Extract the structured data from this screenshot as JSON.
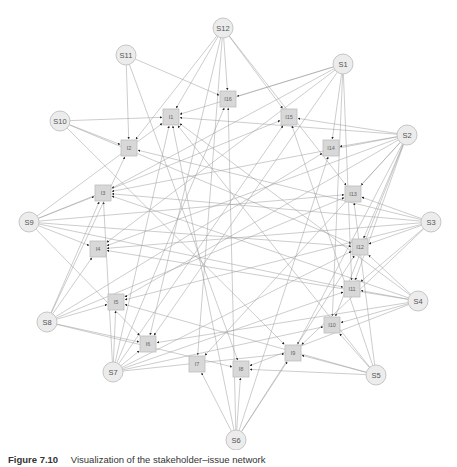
{
  "figure": {
    "caption": {
      "number": "Figure 7.10",
      "text": "Visualization of the stakeholder–issue network"
    },
    "colors": {
      "edge": "#9a9a9a",
      "arrow": "#222222",
      "stakeholder_fill": "#ececec",
      "issue_fill": "#d8d8d8"
    },
    "stakeholders": [
      {
        "id": "S1",
        "label": "S1",
        "x": 343,
        "y": 64
      },
      {
        "id": "S2",
        "label": "S2",
        "x": 407,
        "y": 135
      },
      {
        "id": "S3",
        "label": "S3",
        "x": 431,
        "y": 222
      },
      {
        "id": "S4",
        "label": "S4",
        "x": 418,
        "y": 301
      },
      {
        "id": "S5",
        "label": "S5",
        "x": 376,
        "y": 375
      },
      {
        "id": "S6",
        "label": "S6",
        "x": 236,
        "y": 440
      },
      {
        "id": "S7",
        "label": "S7",
        "x": 113,
        "y": 372
      },
      {
        "id": "S8",
        "label": "S8",
        "x": 47,
        "y": 322
      },
      {
        "id": "S9",
        "label": "S9",
        "x": 29,
        "y": 222
      },
      {
        "id": "S10",
        "label": "S10",
        "x": 60,
        "y": 121
      },
      {
        "id": "S11",
        "label": "S11",
        "x": 126,
        "y": 55
      },
      {
        "id": "S12",
        "label": "S12",
        "x": 223,
        "y": 28
      }
    ],
    "issues": [
      {
        "id": "I1",
        "label": "I1",
        "x": 171,
        "y": 117
      },
      {
        "id": "I2",
        "label": "I2",
        "x": 129,
        "y": 148
      },
      {
        "id": "I3",
        "label": "I3",
        "x": 103,
        "y": 193
      },
      {
        "id": "I4",
        "label": "I4",
        "x": 98,
        "y": 249
      },
      {
        "id": "I5",
        "label": "I5",
        "x": 116,
        "y": 302
      },
      {
        "id": "I6",
        "label": "I6",
        "x": 148,
        "y": 344
      },
      {
        "id": "I7",
        "label": "I7",
        "x": 197,
        "y": 364
      },
      {
        "id": "I8",
        "label": "I8",
        "x": 241,
        "y": 369
      },
      {
        "id": "I9",
        "label": "I9",
        "x": 293,
        "y": 353
      },
      {
        "id": "I10",
        "label": "I10",
        "x": 332,
        "y": 325
      },
      {
        "id": "I11",
        "label": "I11",
        "x": 352,
        "y": 289
      },
      {
        "id": "I12",
        "label": "I12",
        "x": 360,
        "y": 247
      },
      {
        "id": "I13",
        "label": "I13",
        "x": 353,
        "y": 194
      },
      {
        "id": "I14",
        "label": "I14",
        "x": 331,
        "y": 148
      },
      {
        "id": "I15",
        "label": "I15",
        "x": 289,
        "y": 117
      },
      {
        "id": "I16",
        "label": "I16",
        "x": 228,
        "y": 99
      }
    ],
    "edges": [
      [
        "S12",
        "I1"
      ],
      [
        "S12",
        "I16"
      ],
      [
        "S12",
        "I15"
      ],
      [
        "S12",
        "I7"
      ],
      [
        "S12",
        "I6"
      ],
      [
        "S12",
        "I2"
      ],
      [
        "S12",
        "I13"
      ],
      [
        "S11",
        "I2"
      ],
      [
        "S11",
        "I16"
      ],
      [
        "S11",
        "I8"
      ],
      [
        "S10",
        "I1"
      ],
      [
        "S10",
        "I2"
      ],
      [
        "S10",
        "I12"
      ],
      [
        "S10",
        "I9"
      ],
      [
        "S1",
        "I16"
      ],
      [
        "S1",
        "I1"
      ],
      [
        "S1",
        "I3"
      ],
      [
        "S1",
        "I14"
      ],
      [
        "S1",
        "I11"
      ],
      [
        "S1",
        "I4"
      ],
      [
        "S1",
        "I6"
      ],
      [
        "S1",
        "I10"
      ],
      [
        "S2",
        "I15"
      ],
      [
        "S2",
        "I14"
      ],
      [
        "S2",
        "I3"
      ],
      [
        "S2",
        "I13"
      ],
      [
        "S2",
        "I4"
      ],
      [
        "S2",
        "I11"
      ],
      [
        "S2",
        "I12"
      ],
      [
        "S2",
        "I10"
      ],
      [
        "S2",
        "I9"
      ],
      [
        "S2",
        "I5"
      ],
      [
        "S2",
        "I7"
      ],
      [
        "S2",
        "I1"
      ],
      [
        "S3",
        "I13"
      ],
      [
        "S3",
        "I12"
      ],
      [
        "S3",
        "I3"
      ],
      [
        "S3",
        "I5"
      ],
      [
        "S3",
        "I9"
      ],
      [
        "S3",
        "I4"
      ],
      [
        "S3",
        "I11"
      ],
      [
        "S3",
        "I2"
      ],
      [
        "S4",
        "I12"
      ],
      [
        "S4",
        "I11"
      ],
      [
        "S4",
        "I10"
      ],
      [
        "S4",
        "I4"
      ],
      [
        "S4",
        "I3"
      ],
      [
        "S4",
        "I6"
      ],
      [
        "S4",
        "I8"
      ],
      [
        "S4",
        "I1"
      ],
      [
        "S5",
        "I13"
      ],
      [
        "S5",
        "I10"
      ],
      [
        "S5",
        "I9"
      ],
      [
        "S5",
        "I8"
      ],
      [
        "S5",
        "I1"
      ],
      [
        "S5",
        "I15"
      ],
      [
        "S5",
        "I5"
      ],
      [
        "S6",
        "I8"
      ],
      [
        "S6",
        "I7"
      ],
      [
        "S6",
        "I9"
      ],
      [
        "S6",
        "I16"
      ],
      [
        "S6",
        "I1"
      ],
      [
        "S6",
        "I14"
      ],
      [
        "S6",
        "I12"
      ],
      [
        "S7",
        "I5"
      ],
      [
        "S7",
        "I6"
      ],
      [
        "S7",
        "I3"
      ],
      [
        "S7",
        "I1"
      ],
      [
        "S7",
        "I16"
      ],
      [
        "S7",
        "I15"
      ],
      [
        "S7",
        "I11"
      ],
      [
        "S7",
        "I12"
      ],
      [
        "S7",
        "I9"
      ],
      [
        "S7",
        "I10"
      ],
      [
        "S8",
        "I4"
      ],
      [
        "S8",
        "I5"
      ],
      [
        "S8",
        "I6"
      ],
      [
        "S8",
        "I8"
      ],
      [
        "S8",
        "I13"
      ],
      [
        "S8",
        "I14"
      ],
      [
        "S8",
        "I3"
      ],
      [
        "S8",
        "I2"
      ],
      [
        "S9",
        "I3"
      ],
      [
        "S9",
        "I4"
      ],
      [
        "S9",
        "I13"
      ],
      [
        "S9",
        "I12"
      ],
      [
        "S9",
        "I11"
      ],
      [
        "S9",
        "I15"
      ],
      [
        "S9",
        "I1"
      ],
      [
        "S9",
        "I6"
      ]
    ]
  }
}
